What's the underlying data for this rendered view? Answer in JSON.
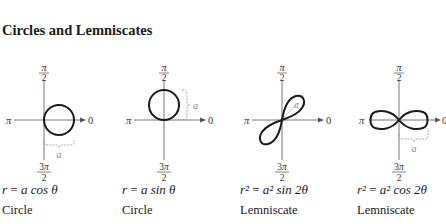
{
  "section": {
    "title": "Circles and Lemniscates"
  },
  "axis_labels": {
    "top": "π/2",
    "bottom": "3π/2",
    "left": "π",
    "right": "0",
    "dimension": "a"
  },
  "panels": [
    {
      "equation_lhs": "r",
      "equation_rhs": "a cos θ",
      "curve_name": "Circle"
    },
    {
      "equation_lhs": "r",
      "equation_rhs": "a sin θ",
      "curve_name": "Circle"
    },
    {
      "equation_lhs": "r²",
      "equation_rhs": "a² sin 2θ",
      "curve_name": "Lemniscate"
    },
    {
      "equation_lhs": "r²",
      "equation_rhs": "a² cos 2θ",
      "curve_name": "Lemniscate"
    }
  ],
  "colors": {
    "curve": "#1a1a1a",
    "axis": "#555555",
    "annotation": "#888888"
  }
}
